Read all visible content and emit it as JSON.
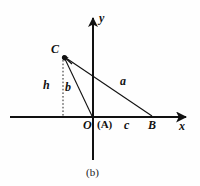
{
  "figure": {
    "caption": "(b)",
    "background_color": "#fefefe",
    "stroke_color": "#111111",
    "axes": {
      "x_label": "x",
      "y_label": "y",
      "origin_label": "O",
      "x_axis": {
        "x1": 10,
        "y1": 117,
        "x2": 190,
        "y2": 117
      },
      "y_axis": {
        "x1": 93,
        "y1": 14,
        "x2": 93,
        "y2": 160
      }
    },
    "points": [
      {
        "name": "C",
        "label": "C",
        "x": 63,
        "y": 56,
        "label_x": 51,
        "label_y": 44,
        "marker": "arrow-dot"
      },
      {
        "name": "A",
        "label": "(A)",
        "x": 93,
        "y": 117,
        "label_x": 99,
        "label_y": 119,
        "marker": "none"
      },
      {
        "name": "B",
        "label": "B",
        "x": 152,
        "y": 117,
        "label_x": 149,
        "label_y": 119,
        "marker": "none"
      },
      {
        "name": "O",
        "label": "O",
        "x": 93,
        "y": 117,
        "label_x": 84,
        "label_y": 119,
        "marker": "none"
      }
    ],
    "segments": [
      {
        "name": "side-a",
        "label": "a",
        "from": "C",
        "to": "B",
        "style": "solid",
        "label_x": 120,
        "label_y": 76
      },
      {
        "name": "side-b",
        "label": "b",
        "from": "C",
        "to": "O",
        "style": "solid",
        "label_x": 65,
        "label_y": 82
      },
      {
        "name": "side-c",
        "label": "c",
        "from": "O",
        "to": "B",
        "style": "axis-overlay",
        "label_x": 124,
        "label_y": 119
      },
      {
        "name": "height-h",
        "label": "h",
        "from": "C",
        "to": "foot",
        "style": "dotted",
        "label_x": 43,
        "label_y": 80
      }
    ]
  }
}
